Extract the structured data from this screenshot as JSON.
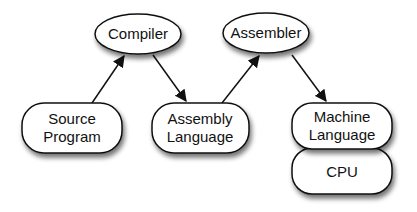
{
  "diagram": {
    "nodes": {
      "compiler": {
        "label": "Compiler",
        "shape": "ellipse"
      },
      "assembler": {
        "label": "Assembler",
        "shape": "ellipse"
      },
      "source_program": {
        "line1": "Source",
        "line2": "Program",
        "shape": "rounded-rect"
      },
      "assembly_language": {
        "line1": "Assembly",
        "line2": "Language",
        "shape": "rounded-rect"
      },
      "machine_language": {
        "line1": "Machine",
        "line2": "Language",
        "shape": "rounded-rect"
      },
      "cpu": {
        "label": "CPU",
        "shape": "rounded-rect"
      }
    },
    "edges": [
      {
        "from": "Source Program",
        "to": "Compiler"
      },
      {
        "from": "Compiler",
        "to": "Assembly Language"
      },
      {
        "from": "Assembly Language",
        "to": "Assembler"
      },
      {
        "from": "Assembler",
        "to": "Machine Language"
      }
    ],
    "colors": {
      "stroke": "#111111",
      "fill": "#ffffff",
      "shadow": "#888888"
    }
  }
}
